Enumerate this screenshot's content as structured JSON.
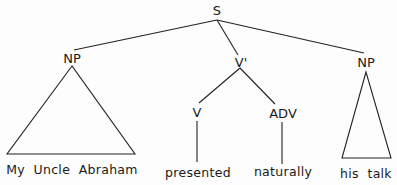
{
  "diagram": {
    "type": "syntax-tree",
    "nodes": {
      "root": "S",
      "subject": "NP",
      "vbar": "V'",
      "verb": "V",
      "adverb": "ADV",
      "object": "NP"
    },
    "leaves": {
      "subject": "My  Uncle  Abraham",
      "verb": "presented",
      "adverb": "naturally",
      "object": "his  talk"
    },
    "edges": [
      [
        "S",
        "NP (subject)"
      ],
      [
        "S",
        "V'"
      ],
      [
        "S",
        "NP (object)"
      ],
      [
        "V'",
        "V"
      ],
      [
        "V'",
        "ADV"
      ],
      [
        "V",
        "presented"
      ],
      [
        "ADV",
        "naturally"
      ]
    ],
    "triangles": [
      "NP (subject) -> My Uncle Abraham",
      "NP (object) -> his talk"
    ],
    "line_color": "#222222"
  }
}
